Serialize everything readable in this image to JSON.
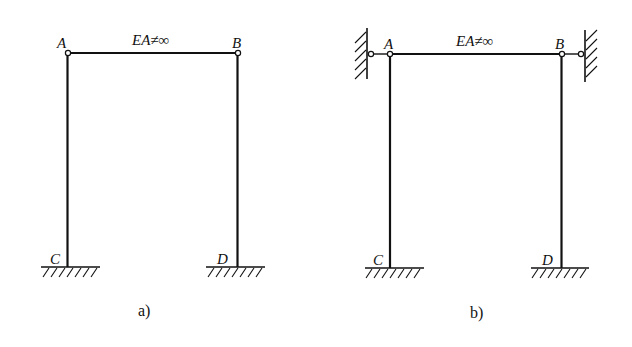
{
  "figure": {
    "panels": [
      {
        "id": "a",
        "caption": "a)",
        "beam_label": "EA≠∞",
        "nodes": {
          "A": "A",
          "B": "B",
          "C": "C",
          "D": "D"
        },
        "description": "Portal frame with hinged beam AB (axially deformable) on fixed-base columns AC and BD"
      },
      {
        "id": "b",
        "caption": "b)",
        "beam_label": "EA≠∞",
        "nodes": {
          "A": "A",
          "B": "B",
          "C": "C",
          "D": "D"
        },
        "description": "Same frame with horizontal link supports to rigid walls at A and B"
      }
    ],
    "colors": {
      "line": "#111111",
      "background": "#ffffff",
      "hinge_fill": "#ffffff"
    }
  }
}
